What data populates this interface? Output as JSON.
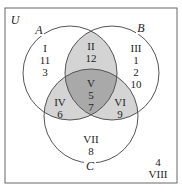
{
  "universe_label": "U",
  "sets": [
    {
      "name": "A",
      "label": "A"
    },
    {
      "name": "B",
      "label": "B"
    },
    {
      "name": "C",
      "label": "C"
    }
  ],
  "regions": [
    {
      "id": "I",
      "roman": "I",
      "elements": [
        "11",
        "3"
      ]
    },
    {
      "id": "II",
      "roman": "II",
      "elements": [
        "12"
      ]
    },
    {
      "id": "III",
      "roman": "III",
      "elements": [
        "1",
        "2",
        "10"
      ]
    },
    {
      "id": "IV",
      "roman": "IV",
      "elements": [
        "6"
      ]
    },
    {
      "id": "V",
      "roman": "V",
      "elements": [
        "5",
        "7"
      ]
    },
    {
      "id": "VI",
      "roman": "VI",
      "elements": [
        "9"
      ]
    },
    {
      "id": "VII",
      "roman": "VII",
      "elements": [
        "8"
      ]
    },
    {
      "id": "VIII",
      "roman": "VIII",
      "elements": [
        "4"
      ]
    }
  ],
  "colors": {
    "pairwise_shade": "#d4d4d4",
    "triple_shade": "#a9a9a9",
    "stroke": "#555555"
  }
}
